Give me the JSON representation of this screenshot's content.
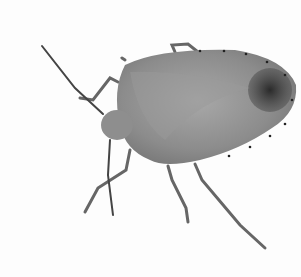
{
  "image": {
    "subject": "stink bug",
    "description": "Grayscale photograph of a shield-shaped stink bug viewed from above on a white background",
    "background_color": "#fdfdfd",
    "body_color": "#8a8a8a",
    "wingtip_color": "#3a3a3a",
    "leg_color": "#6a6a6a"
  }
}
